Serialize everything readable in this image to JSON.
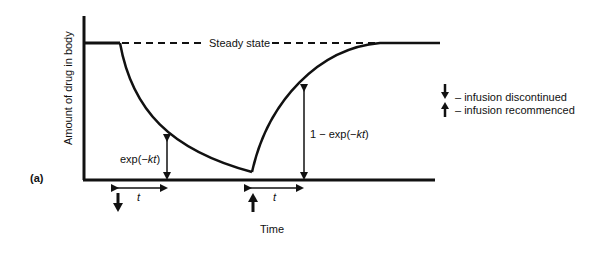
{
  "diagram": {
    "panel_label": "(a)",
    "y_axis_label": "Amount of drug in body",
    "x_axis_label": "Time",
    "steady_state_label": "Steady state",
    "decay_label_prefix": "exp(−",
    "decay_label_var": "kt",
    "decay_label_suffix": ")",
    "recovery_label_prefix": "1 − exp(−",
    "recovery_label_var": "kt",
    "recovery_label_suffix": ")",
    "interval_label_1": "t",
    "interval_label_2": "t",
    "legend": {
      "discontinued": "– infusion discontinued",
      "recommenced": "– infusion recommenced"
    }
  }
}
